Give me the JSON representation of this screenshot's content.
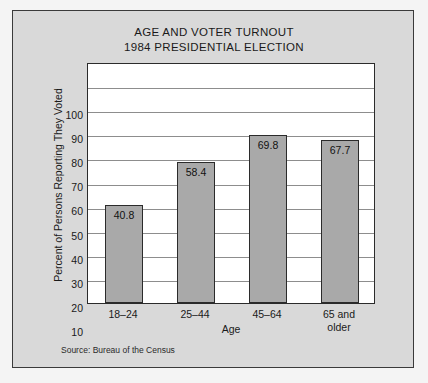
{
  "chart_data": {
    "type": "bar",
    "title": "AGE AND VOTER TURNOUT",
    "subtitle": "1984 PRESIDENTIAL ELECTION",
    "categories": [
      "18–24",
      "25–44",
      "45–64",
      "65 and older"
    ],
    "category_lines": [
      [
        "18–24"
      ],
      [
        "25–44"
      ],
      [
        "45–64"
      ],
      [
        "65 and",
        "older"
      ]
    ],
    "values": [
      40.8,
      58.4,
      69.8,
      67.7
    ],
    "value_labels": [
      "40.8",
      "58.4",
      "69.8",
      "67.7"
    ],
    "xlabel": "Age",
    "ylabel": "Percent of Persons Reporting They Voted",
    "ylim": [
      0,
      100
    ],
    "yticks": [
      100,
      90,
      80,
      70,
      60,
      50,
      40,
      30,
      20,
      10
    ],
    "ytick_labels": [
      "100",
      "90",
      "80",
      "70",
      "60",
      "50",
      "40",
      "30",
      "20",
      "10"
    ],
    "grid": true,
    "legend": null,
    "annotations": [
      "Source: Bureau of the Census"
    ],
    "colors": {
      "bar_fill": "#a9a9a9",
      "bar_edge": "#2b2b2b",
      "plot_background": "#ffffff",
      "panel_background": "#d9d9d9",
      "figure_background": "#f4f4f4",
      "gridline": "#8d8d8d",
      "text": "#1a1a1a"
    }
  },
  "source_note": "Source: Bureau of the Census"
}
